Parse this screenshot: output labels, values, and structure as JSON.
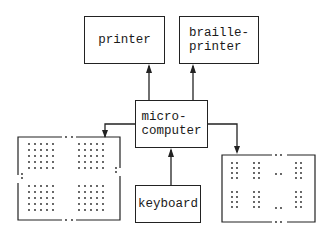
{
  "diagram": {
    "nodes": {
      "printer": {
        "label": "printer"
      },
      "braille_printer": {
        "label": "braille-\nprinter"
      },
      "microcomputer": {
        "label": "micro-\ncomputer"
      },
      "keyboard": {
        "label": "keyboard"
      },
      "visual_display": {
        "label": "",
        "description": "dot-matrix print display (4 blocks of 5x5 dots)"
      },
      "braille_display": {
        "label": "",
        "description": "braille cell display"
      }
    },
    "edges": [
      {
        "from": "microcomputer",
        "to": "printer"
      },
      {
        "from": "microcomputer",
        "to": "braille_printer"
      },
      {
        "from": "microcomputer",
        "to": "visual_display"
      },
      {
        "from": "microcomputer",
        "to": "braille_display"
      },
      {
        "from": "keyboard",
        "to": "microcomputer"
      }
    ]
  }
}
